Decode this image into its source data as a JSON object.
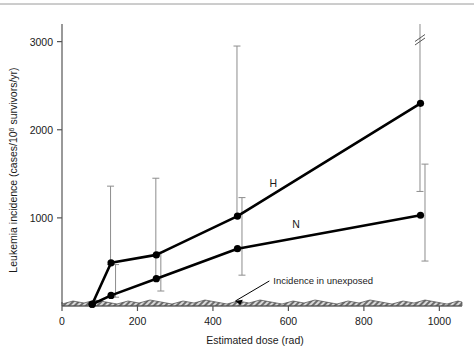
{
  "chart_data": {
    "type": "line",
    "title": "",
    "xlabel": "Estimated dose (rad)",
    "ylabel_parts": {
      "pre": "Leukemia incidence (cases/10",
      "exp": "6",
      "post": " survivors/yr)"
    },
    "ylabel": "Leukemia incidence (cases/10^6 survivors/yr)",
    "xlim": [
      0,
      1060
    ],
    "ylim": [
      0,
      3200
    ],
    "xticks": [
      0,
      200,
      400,
      600,
      800,
      1000
    ],
    "xticklabels": [
      "0",
      "200",
      "400",
      "600",
      "800",
      "1000"
    ],
    "yticks": [
      1000,
      2000,
      3000
    ],
    "yticklabels": [
      "1000",
      "2000",
      "3000"
    ],
    "grid": false,
    "legend_position": "inline-labels",
    "series": [
      {
        "name": "H",
        "label": "H",
        "label_x": 560,
        "label_y": 1350,
        "marker": "filled-circle",
        "x": [
          80,
          130,
          250,
          465,
          950
        ],
        "values": [
          20,
          490,
          580,
          1020,
          2300
        ],
        "err_low": [
          20,
          20,
          280,
          20,
          1000
        ],
        "err_high": [
          20,
          870,
          870,
          1930,
          1000
        ],
        "err_high_broken": [
          false,
          false,
          false,
          false,
          true
        ]
      },
      {
        "name": "N",
        "label": "N",
        "label_x": 620,
        "label_y": 880,
        "marker": "filled-circle",
        "x": [
          80,
          130,
          250,
          465,
          950
        ],
        "values": [
          20,
          120,
          310,
          650,
          1030
        ],
        "err_low": [
          20,
          20,
          140,
          300,
          520
        ],
        "err_high": [
          20,
          350,
          300,
          580,
          580
        ],
        "err_high_broken": [
          false,
          false,
          false,
          false,
          false
        ]
      }
    ],
    "band": {
      "name": "Incidence in unexposed",
      "annotation": "Incidence in unexposed",
      "annotation_x": 560,
      "annotation_y": 250,
      "value": 45,
      "style": "hatched"
    }
  }
}
